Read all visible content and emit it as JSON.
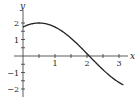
{
  "chart_data": {
    "type": "line",
    "title": "",
    "xlabel": "x",
    "ylabel": "y",
    "xlim": [
      0,
      3.14
    ],
    "ylim": [
      -2.3,
      2.4
    ],
    "grid": false,
    "legend": null,
    "x_ticks": [
      1,
      2,
      3
    ],
    "x_minor_ticks_step": 0.5,
    "y_ticks": [
      2,
      1,
      -1,
      -2
    ],
    "x_tick_labels": [
      "1",
      "2",
      "3"
    ],
    "y_tick_labels": [
      "2",
      "1",
      "−1",
      "−2"
    ],
    "series": [
      {
        "name": "y = f(x)",
        "x": [
          0,
          0.25,
          0.5,
          0.75,
          1.0,
          1.25,
          1.5,
          1.75,
          2.0,
          2.07,
          2.25,
          2.5,
          2.75,
          3.0,
          3.14
        ],
        "values": [
          1.76,
          1.94,
          2.0,
          1.94,
          1.76,
          1.46,
          1.08,
          0.63,
          0.14,
          0.0,
          -0.35,
          -0.83,
          -1.26,
          -1.6,
          -1.75
        ]
      }
    ],
    "colors": {
      "curve": "#222222",
      "axes": "#333333"
    }
  }
}
